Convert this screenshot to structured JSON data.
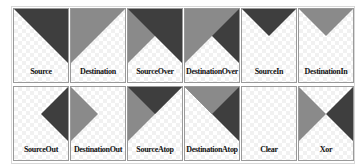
{
  "colors": {
    "source": "#3e3e3e",
    "destination": "#8a8a8a",
    "border": "#9a9a9a"
  },
  "panels": [
    {
      "label": "Source"
    },
    {
      "label": "Destination"
    },
    {
      "label": "SourceOver"
    },
    {
      "label": "DestinationOver"
    },
    {
      "label": "SourceIn"
    },
    {
      "label": "DestinationIn"
    },
    {
      "label": "SourceOut"
    },
    {
      "label": "DestinationOut"
    },
    {
      "label": "SourceAtop"
    },
    {
      "label": "DestinationAtop"
    },
    {
      "label": "Clear"
    },
    {
      "label": "Xor"
    }
  ]
}
